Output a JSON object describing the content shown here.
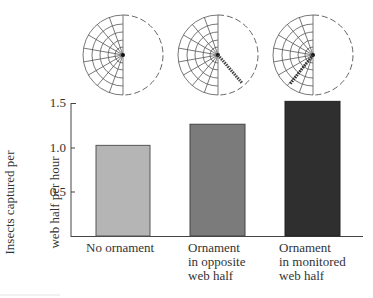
{
  "chart_data": {
    "type": "bar",
    "title": "",
    "xlabel": "",
    "ylabel": "Insects captured per web half per hour",
    "ylabel_lines": [
      "Insects captured per",
      "web half per hour"
    ],
    "categories": [
      "No ornament",
      "Ornament in opposite web half",
      "Ornament in monitored web half"
    ],
    "category_lines": [
      [
        "No ornament"
      ],
      [
        "Ornament",
        "in opposite",
        "web half"
      ],
      [
        "Ornament",
        "in monitored",
        "web half"
      ]
    ],
    "values": [
      1.03,
      1.27,
      1.53
    ],
    "bar_colors": [
      "#b5b5b5",
      "#7b7b7b",
      "#2f2f2f"
    ],
    "ylim": [
      0,
      1.5
    ],
    "yticks": [
      0.5,
      1.0,
      1.5
    ],
    "ytick_labels": [
      "0.5",
      "1.0",
      "1.5"
    ],
    "grid": false,
    "legend": "none",
    "annotations": [
      {
        "type": "web-diagram",
        "category": "No ornament",
        "ornament": "none"
      },
      {
        "type": "web-diagram",
        "category": "Ornament in opposite web half",
        "ornament": "in empty half, lower-right"
      },
      {
        "type": "web-diagram",
        "category": "Ornament in monitored web half",
        "ornament": "in web half, lower-left"
      }
    ]
  },
  "axis": {
    "tick_labels": [
      "0.5",
      "1.0",
      "1.5"
    ]
  },
  "labels": {
    "ylabel_line1": "Insects captured per",
    "ylabel_line2": "web half per hour",
    "cat1": "No ornament",
    "cat2": "Ornament\nin opposite\nweb half",
    "cat3": "Ornament\nin monitored\nweb half"
  }
}
